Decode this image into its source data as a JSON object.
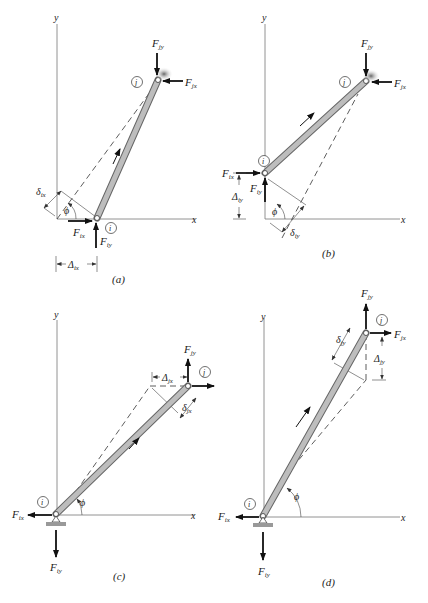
{
  "figure": {
    "panels": [
      {
        "id": "a",
        "caption": "(a)",
        "axes": {
          "x": "x",
          "y": "y"
        },
        "nodes": {
          "near": "i",
          "far": "j"
        },
        "forces": {
          "Fix": "F",
          "Fix_sub": "ix",
          "Fiy": "F",
          "Fiy_sub": "iy",
          "Fjx": "F",
          "Fjx_sub": "jx",
          "Fjy": "F",
          "Fjy_sub": "jy"
        },
        "displacement": {
          "Delta": "Δ",
          "Delta_sub": "ix",
          "delta": "δ",
          "delta_sub": "ix"
        },
        "angle": "ϕ"
      },
      {
        "id": "b",
        "caption": "(b)",
        "axes": {
          "x": "x",
          "y": "y"
        },
        "nodes": {
          "near": "i",
          "far": "j"
        },
        "forces": {
          "Fix": "F",
          "Fix_sub": "ix",
          "Fiy": "F",
          "Fiy_sub": "iy",
          "Fjx": "F",
          "Fjx_sub": "jx",
          "Fjy": "F",
          "Fjy_sub": "jy"
        },
        "displacement": {
          "Delta": "Δ",
          "Delta_sub": "iy",
          "delta": "δ",
          "delta_sub": "iy"
        },
        "angle": "ϕ"
      },
      {
        "id": "c",
        "caption": "(c)",
        "axes": {
          "x": "x",
          "y": "y"
        },
        "nodes": {
          "near": "i",
          "far": "j"
        },
        "forces": {
          "Fix": "F",
          "Fix_sub": "ix",
          "Fiy": "F",
          "Fiy_sub": "iy",
          "Fjx": "F",
          "Fjx_sub": "jx",
          "Fjy": "F",
          "Fjy_sub": "jy"
        },
        "displacement": {
          "Delta": "Δ",
          "Delta_sub": "jx",
          "delta": "δ",
          "delta_sub": "jx"
        },
        "angle": "ϕ"
      },
      {
        "id": "d",
        "caption": "(d)",
        "axes": {
          "x": "x",
          "y": "y"
        },
        "nodes": {
          "near": "i",
          "far": "j"
        },
        "forces": {
          "Fix": "F",
          "Fix_sub": "ix",
          "Fiy": "F",
          "Fiy_sub": "iy",
          "Fjx": "F",
          "Fjx_sub": "jx",
          "Fjy": "F",
          "Fjy_sub": "jy"
        },
        "displacement": {
          "Delta": "Δ",
          "Delta_sub": "jy",
          "delta": "δ",
          "delta_sub": "jy"
        },
        "angle": "ϕ"
      }
    ]
  }
}
